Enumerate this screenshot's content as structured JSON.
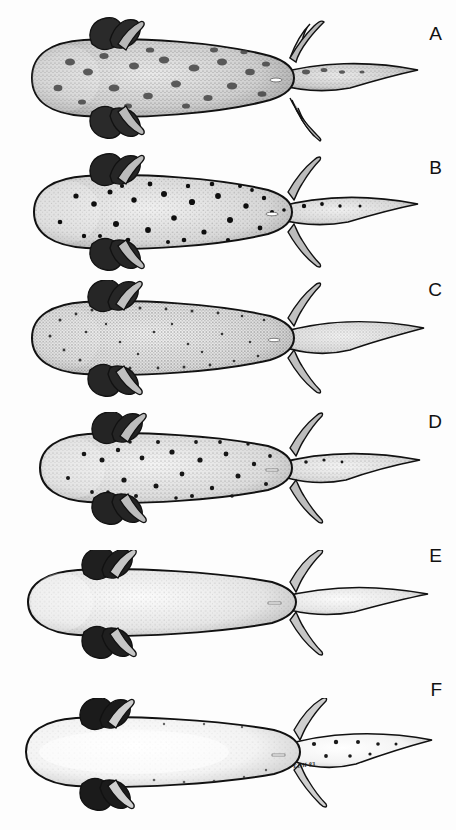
{
  "figure": {
    "running_head": "SYSTEMATICS AND EVOLUTION OF THE SMALL STREAMSIDE SALAMANDERS",
    "signature": "EDH 83",
    "background_color": "#ffffff",
    "ink_color": "#111111",
    "panel_count": 6
  },
  "panels": [
    {
      "label": "A",
      "pattern": "coarse dark blotches over dense stipple",
      "body_tone": "medium",
      "spot_style": "large-blotch",
      "spot_count": 26,
      "gills": "bushy, dark",
      "vent_mark": true,
      "tail": "broad finned paddle"
    },
    {
      "label": "B",
      "pattern": "bold round black spots over light stipple",
      "body_tone": "light",
      "spot_style": "round-dark",
      "spot_count": 34,
      "gills": "bushy, dark",
      "vent_mark": true,
      "tail": "broad finned paddle"
    },
    {
      "label": "C",
      "pattern": "fine dense speckling, no large spots",
      "body_tone": "light",
      "spot_style": "fine-speckle",
      "spot_count": 60,
      "gills": "bushy, dark",
      "vent_mark": true,
      "tail": "broad finned paddle"
    },
    {
      "label": "D",
      "pattern": "scattered medium spots, moderate stipple",
      "body_tone": "light",
      "spot_style": "medium-scatter",
      "spot_count": 30,
      "gills": "bushy, dark",
      "vent_mark": true,
      "tail": "tapered finned paddle"
    },
    {
      "label": "E",
      "pattern": "plain, uniform smooth stipple, unspotted",
      "body_tone": "pale",
      "spot_style": "none",
      "spot_count": 0,
      "gills": "bushy, dark",
      "vent_mark": true,
      "tail": "slender finned paddle"
    },
    {
      "label": "F",
      "pattern": "palest, pigment limited to margins and snout",
      "body_tone": "palest",
      "spot_style": "sparse-marginal",
      "spot_count": 12,
      "gills": "bushy, dark",
      "vent_mark": true,
      "tail": "slender finned paddle"
    }
  ]
}
